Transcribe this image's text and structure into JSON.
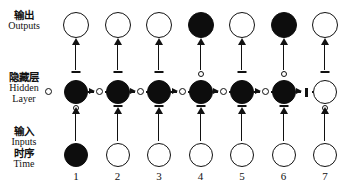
{
  "figure": {
    "row_labels": {
      "outputs": {
        "cn": "输出",
        "en": "Outputs"
      },
      "hidden": {
        "cn": "隐藏层",
        "en": "Hidden",
        "en2": "Layer"
      },
      "inputs": {
        "cn": "输入",
        "en": "Inputs",
        "cn2": "时序",
        "en2": "Time"
      }
    }
  },
  "chart_data": {
    "type": "diagram",
    "title": "",
    "xlabel": "Time",
    "ylabel": "",
    "categories": [
      "1",
      "2",
      "3",
      "4",
      "5",
      "6",
      "7"
    ],
    "legend": {
      "filled_node": "active / on",
      "open_node": "inactive / off",
      "gate_open_circle": "gate open",
      "gate_closed_dash": "gate closed"
    },
    "series": [
      {
        "name": "Outputs",
        "values": [
          "open",
          "open",
          "open",
          "filled",
          "open",
          "filled",
          "open"
        ]
      },
      {
        "name": "Hidden Layer",
        "values": [
          "filled",
          "filled",
          "filled",
          "filled",
          "filled",
          "filled",
          "open"
        ]
      },
      {
        "name": "Inputs",
        "values": [
          "filled",
          "open",
          "open",
          "open",
          "open",
          "open",
          "open"
        ]
      }
    ],
    "gates": {
      "output_gate_above_hidden": [
        "closed",
        "closed",
        "closed",
        "open",
        "closed",
        "open",
        "closed"
      ],
      "input_gate_below_hidden": [
        "open",
        "closed",
        "closed",
        "closed",
        "closed",
        "closed",
        "open"
      ],
      "forget_gate_recurrent_in": [
        "open",
        "open",
        "open",
        "open",
        "open",
        "open",
        "closed"
      ]
    },
    "time_labels": [
      "1",
      "2",
      "3",
      "4",
      "5",
      "6",
      "7"
    ]
  }
}
